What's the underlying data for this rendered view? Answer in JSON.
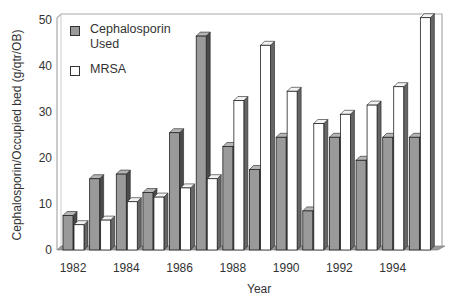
{
  "chart_data": {
    "type": "bar",
    "title": "",
    "xlabel": "Year",
    "ylabel": "Cephalosporin/Occupied bed (g/qtr/OB)",
    "ylim": [
      0,
      50
    ],
    "yticks": [
      0,
      10,
      20,
      30,
      40,
      50
    ],
    "xtick_labels": [
      "1982",
      "1984",
      "1986",
      "1988",
      "1990",
      "1992",
      "1994"
    ],
    "categories": [
      "1982",
      "1983",
      "1984",
      "1985",
      "1986",
      "1987",
      "1988",
      "1989",
      "1990",
      "1991",
      "1992",
      "1993",
      "1994",
      "1995"
    ],
    "series": [
      {
        "name": "Cephalosporin Used",
        "color": "#9a9a9a",
        "values": [
          7.5,
          15.5,
          16.5,
          12.5,
          25.5,
          46.5,
          22.5,
          17.5,
          24.5,
          8.5,
          24.5,
          19.5,
          24.5,
          24.5
        ]
      },
      {
        "name": "MRSA",
        "color": "#ffffff",
        "values": [
          5.5,
          6.5,
          10.5,
          11.5,
          13.5,
          15.5,
          32.5,
          44.5,
          34.5,
          27.5,
          29.5,
          31.5,
          35.5,
          50.5
        ]
      }
    ],
    "grid": false,
    "legend_position": "upper-left inside",
    "style": "3d bars"
  },
  "legend": {
    "items": [
      {
        "label": "Cephalosporin Used",
        "color": "#9a9a9a"
      },
      {
        "label": "MRSA",
        "color": "#ffffff"
      }
    ]
  },
  "axes": {
    "x_title": "Year",
    "y_title": "Cephalosporin/Occupied bed (g/qtr/OB)"
  }
}
